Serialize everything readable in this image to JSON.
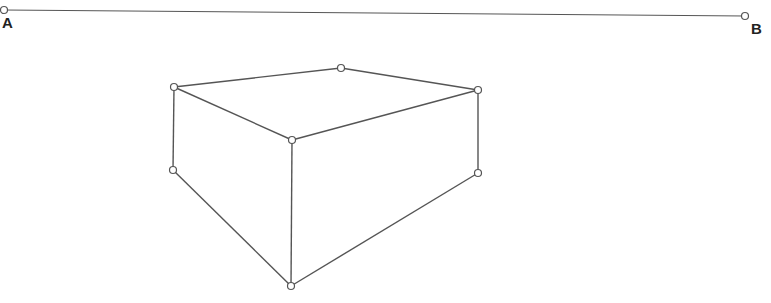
{
  "diagram": {
    "stroke_color": "#555555",
    "points": [
      {
        "id": "A",
        "label": "A",
        "x": 4,
        "y": 10,
        "lx": 2,
        "ly": 14
      },
      {
        "id": "B",
        "label": "B",
        "x": 745,
        "y": 16,
        "lx": 752,
        "ly": 21
      },
      {
        "id": "top-left",
        "x": 174,
        "y": 87
      },
      {
        "id": "top-back",
        "x": 341,
        "y": 68
      },
      {
        "id": "top-right",
        "x": 478,
        "y": 90
      },
      {
        "id": "front-top",
        "x": 292,
        "y": 140
      },
      {
        "id": "left-bottom",
        "x": 173,
        "y": 170
      },
      {
        "id": "right-bottom",
        "x": 478,
        "y": 173
      },
      {
        "id": "front-bottom",
        "x": 291,
        "y": 286
      }
    ],
    "segments": [
      [
        "A",
        "B"
      ],
      [
        "top-left",
        "top-back"
      ],
      [
        "top-back",
        "top-right"
      ],
      [
        "top-left",
        "front-top"
      ],
      [
        "front-top",
        "top-right"
      ],
      [
        "top-left",
        "left-bottom"
      ],
      [
        "top-right",
        "right-bottom"
      ],
      [
        "front-top",
        "front-bottom"
      ],
      [
        "left-bottom",
        "front-bottom"
      ],
      [
        "right-bottom",
        "front-bottom"
      ]
    ],
    "labels": {
      "A": "A",
      "B": "B"
    }
  }
}
